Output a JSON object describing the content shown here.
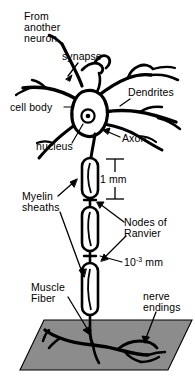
{
  "figure": {
    "background_color": "#ffffff",
    "ink_color": "#000000",
    "muscle_fiber_fill": "#8c8c8c",
    "muscle_fiber_stroke": "#000000"
  },
  "labels": {
    "from_another_neuron": "From\nanother\nneuron",
    "synapse": "synapse",
    "dendrites": "Dendrites",
    "cell_body": "cell body",
    "nucleus": "nucleus",
    "axon": "Axon",
    "myelin_sheaths": "Myelin\nsheaths",
    "nodes_of_ranvier": "Nodes of\nRanvier",
    "muscle_fiber": "Muscle\nFiber",
    "nerve_endings": "nerve\nendings"
  },
  "scales": {
    "myelin_segment_length": {
      "value": "1 mm",
      "mantissa": "1",
      "unit": "mm"
    },
    "node_gap_length": {
      "value": "10-3 mm",
      "mantissa": "10",
      "exponent": "-3",
      "unit": "mm"
    }
  },
  "parts": {
    "soma": "cell-body",
    "nucleus_marker": "nucleus-dot",
    "dendrite_count_visible": 6,
    "myelin_segment_count": 3,
    "node_count": 2
  }
}
